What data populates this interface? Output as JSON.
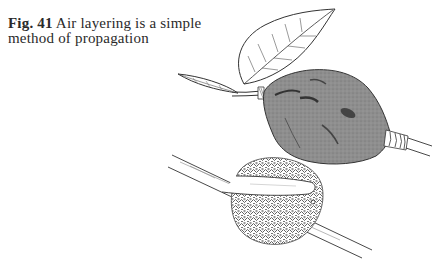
{
  "caption": {
    "figure_label": "Fig. 41",
    "text": " Air layering is a simple method of propagation"
  },
  "illustration": {
    "subject": "air-layering",
    "parts": [
      "leaves",
      "wrapped-polythene-bag",
      "wire-tie",
      "branch",
      "sphagnum-moss-ball"
    ],
    "colors": {
      "bag_fill": "#8e8e8e",
      "line": "#333333",
      "moss": "#555555"
    }
  }
}
